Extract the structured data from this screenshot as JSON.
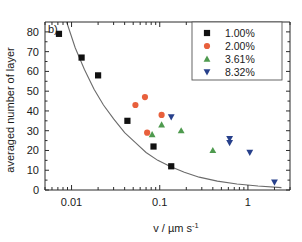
{
  "chart_data": {
    "type": "scatter",
    "title": "",
    "panel_label": "b)",
    "xlabel": "v / µm s⁻¹",
    "ylabel": "averaged number of layer",
    "xscale": "log",
    "yscale": "linear",
    "xlim": [
      0.005,
      3.0
    ],
    "ylim": [
      0,
      85
    ],
    "xticks": [
      0.01,
      0.1,
      1
    ],
    "xtick_labels": [
      "0.01",
      "0.1",
      "1"
    ],
    "yticks": [
      0,
      10,
      20,
      30,
      40,
      50,
      60,
      70,
      80
    ],
    "ytick_labels": [
      "0",
      "10",
      "20",
      "30",
      "40",
      "50",
      "60",
      "70",
      "80"
    ],
    "grid": false,
    "legend_position": "top-right",
    "series": [
      {
        "name": "1.00%",
        "marker": "square",
        "color": "#111111",
        "points": [
          {
            "x": 0.0072,
            "y": 79
          },
          {
            "x": 0.013,
            "y": 67
          },
          {
            "x": 0.02,
            "y": 58
          },
          {
            "x": 0.043,
            "y": 35
          },
          {
            "x": 0.085,
            "y": 22
          },
          {
            "x": 0.135,
            "y": 12
          }
        ]
      },
      {
        "name": "2.00%",
        "marker": "circle",
        "color": "#E8603C",
        "points": [
          {
            "x": 0.053,
            "y": 43
          },
          {
            "x": 0.068,
            "y": 47
          },
          {
            "x": 0.105,
            "y": 38
          },
          {
            "x": 0.072,
            "y": 29
          }
        ]
      },
      {
        "name": "3.61%",
        "marker": "triangle-up",
        "color": "#4E9A4E",
        "points": [
          {
            "x": 0.082,
            "y": 28
          },
          {
            "x": 0.105,
            "y": 33
          },
          {
            "x": 0.175,
            "y": 30
          },
          {
            "x": 0.4,
            "y": 20
          }
        ]
      },
      {
        "name": "8.32%",
        "marker": "triangle-down",
        "color": "#27408B",
        "points": [
          {
            "x": 0.135,
            "y": 37
          },
          {
            "x": 0.62,
            "y": 26
          },
          {
            "x": 0.62,
            "y": 24
          },
          {
            "x": 1.05,
            "y": 19
          },
          {
            "x": 2.0,
            "y": 4
          }
        ]
      }
    ],
    "fit_curve": {
      "name": "fit",
      "color": "#6b6b6b",
      "points": [
        {
          "x": 0.0088,
          "y": 85
        },
        {
          "x": 0.011,
          "y": 72
        },
        {
          "x": 0.014,
          "y": 61
        },
        {
          "x": 0.018,
          "y": 51
        },
        {
          "x": 0.023,
          "y": 43
        },
        {
          "x": 0.03,
          "y": 36
        },
        {
          "x": 0.04,
          "y": 29
        },
        {
          "x": 0.053,
          "y": 24
        },
        {
          "x": 0.07,
          "y": 19
        },
        {
          "x": 0.095,
          "y": 15
        },
        {
          "x": 0.13,
          "y": 12
        },
        {
          "x": 0.19,
          "y": 9
        },
        {
          "x": 0.28,
          "y": 6.5
        },
        {
          "x": 0.45,
          "y": 4.5
        },
        {
          "x": 0.75,
          "y": 3
        },
        {
          "x": 1.3,
          "y": 2
        },
        {
          "x": 2.4,
          "y": 1.2
        }
      ]
    }
  },
  "legend": {
    "entries": [
      {
        "label": "1.00%"
      },
      {
        "label": "2.00%"
      },
      {
        "label": "3.61%"
      },
      {
        "label": "8.32%"
      }
    ]
  },
  "axis": {
    "xlabel_main": "v / µm s",
    "xlabel_exponent": "-1",
    "ylabel": "averaged number of layer"
  }
}
